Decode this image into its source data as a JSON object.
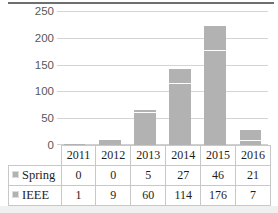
{
  "chart_data": {
    "type": "bar",
    "subtype": "stacked-column",
    "title": "",
    "xlabel": "",
    "ylabel": "",
    "categories": [
      "2011",
      "2012",
      "2013",
      "2014",
      "2015",
      "2016"
    ],
    "series": [
      {
        "name": "Spring",
        "values": [
          0,
          0,
          5,
          27,
          46,
          21
        ],
        "color": "#b2b2b2",
        "stack_position": "top"
      },
      {
        "name": "IEEE",
        "values": [
          1,
          9,
          60,
          114,
          176,
          7
        ],
        "color": "#b2b2b2",
        "stack_position": "bottom"
      }
    ],
    "totals": [
      1,
      9,
      65,
      141,
      222,
      28
    ],
    "ylim": [
      0,
      250
    ],
    "yticks": [
      0,
      50,
      100,
      150,
      200,
      250
    ],
    "ytick_labels": [
      "0",
      "50",
      "100",
      "150",
      "200",
      "250"
    ],
    "grid": "horizontal",
    "legend_position": "data-table",
    "data_table_visible": true
  },
  "table": {
    "corner_label": "",
    "year_headers": [
      "2011",
      "2012",
      "2013",
      "2014",
      "2015",
      "2016"
    ],
    "rows": [
      {
        "series_label": "Spring",
        "swatch_icon": "legend-swatch-icon",
        "values": [
          "0",
          "0",
          "5",
          "27",
          "46",
          "21"
        ]
      },
      {
        "series_label": "IEEE",
        "swatch_icon": "legend-swatch-icon",
        "values": [
          "1",
          "9",
          "60",
          "114",
          "176",
          "7"
        ]
      }
    ]
  },
  "colors": {
    "bar": "#b2b2b2",
    "gridline": "#d4d4d4",
    "table_border": "#c8c8c8",
    "axis_text": "#585858",
    "table_text": "#1d1d1d"
  }
}
